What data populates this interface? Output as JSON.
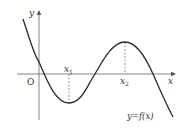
{
  "diagram": {
    "type": "function-graph",
    "axes": {
      "x_label": "x",
      "y_label": "y",
      "origin_label": "O"
    },
    "points": {
      "x1_label": "x",
      "x1_sub": "1",
      "x2_label": "x",
      "x2_sub": "2"
    },
    "curve_label": "y=f(x)",
    "colors": {
      "curve": "#2a2a2a",
      "axis": "#555555",
      "dashed": "#666666"
    }
  }
}
